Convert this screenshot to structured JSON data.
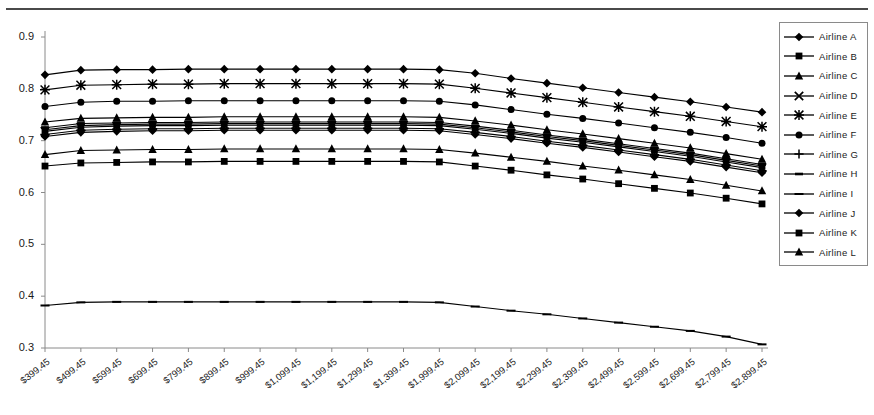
{
  "chart_data": {
    "type": "line",
    "title": "",
    "xlabel": "",
    "ylabel": "",
    "ylim": [
      0.3,
      0.9
    ],
    "ytick_labels": [
      "0.9",
      "0.8",
      "0.7",
      "0.6",
      "0.5",
      "0.4",
      "0.3"
    ],
    "ytick_values": [
      0.9,
      0.8,
      0.7,
      0.6,
      0.5,
      0.4,
      0.3
    ],
    "grid": false,
    "legend_position": "right",
    "categories": [
      "$399.45",
      "$499.45",
      "$599.45",
      "$699.45",
      "$799.45",
      "$899.45",
      "$999.45",
      "$1,099.45",
      "$1,199.45",
      "$1,299.45",
      "$1,399.45",
      "$1,999.45",
      "$2,099.45",
      "$2,199.45",
      "$2,299.45",
      "$2,399.45",
      "$2,499.45",
      "$2,599.45",
      "$2,699.45",
      "$2,799.45",
      "$2,899.45"
    ],
    "series": [
      {
        "name": "Airline A",
        "marker": "diamond",
        "values": [
          0.827,
          0.836,
          0.837,
          0.837,
          0.838,
          0.838,
          0.838,
          0.838,
          0.838,
          0.838,
          0.838,
          0.837,
          0.83,
          0.82,
          0.811,
          0.802,
          0.793,
          0.784,
          0.775,
          0.765,
          0.755
        ]
      },
      {
        "name": "Airline B",
        "marker": "square",
        "values": [
          0.651,
          0.657,
          0.658,
          0.659,
          0.659,
          0.66,
          0.66,
          0.66,
          0.66,
          0.66,
          0.66,
          0.659,
          0.651,
          0.643,
          0.634,
          0.626,
          0.617,
          0.608,
          0.599,
          0.589,
          0.578
        ]
      },
      {
        "name": "Airline C",
        "marker": "triangle",
        "values": [
          0.673,
          0.681,
          0.682,
          0.683,
          0.683,
          0.684,
          0.684,
          0.684,
          0.684,
          0.684,
          0.684,
          0.683,
          0.676,
          0.668,
          0.66,
          0.651,
          0.643,
          0.634,
          0.625,
          0.614,
          0.603
        ]
      },
      {
        "name": "Airline D",
        "marker": "x",
        "values": [
          0.718,
          0.726,
          0.728,
          0.729,
          0.729,
          0.73,
          0.73,
          0.73,
          0.73,
          0.73,
          0.73,
          0.729,
          0.722,
          0.714,
          0.705,
          0.697,
          0.688,
          0.679,
          0.67,
          0.659,
          0.648
        ]
      },
      {
        "name": "Airline E",
        "marker": "star",
        "values": [
          0.798,
          0.807,
          0.808,
          0.809,
          0.809,
          0.81,
          0.81,
          0.81,
          0.81,
          0.81,
          0.81,
          0.809,
          0.801,
          0.792,
          0.783,
          0.774,
          0.765,
          0.756,
          0.747,
          0.737,
          0.727
        ]
      },
      {
        "name": "Airline F",
        "marker": "circle",
        "values": [
          0.766,
          0.774,
          0.776,
          0.776,
          0.777,
          0.777,
          0.777,
          0.777,
          0.777,
          0.777,
          0.777,
          0.776,
          0.769,
          0.76,
          0.751,
          0.743,
          0.734,
          0.725,
          0.716,
          0.706,
          0.695
        ]
      },
      {
        "name": "Airline G",
        "marker": "plus",
        "values": [
          0.712,
          0.72,
          0.722,
          0.723,
          0.723,
          0.724,
          0.724,
          0.724,
          0.724,
          0.724,
          0.724,
          0.723,
          0.716,
          0.708,
          0.699,
          0.691,
          0.682,
          0.673,
          0.664,
          0.653,
          0.642
        ]
      },
      {
        "name": "Airline H",
        "marker": "dash",
        "values": [
          0.725,
          0.733,
          0.734,
          0.735,
          0.735,
          0.736,
          0.736,
          0.736,
          0.736,
          0.736,
          0.736,
          0.735,
          0.728,
          0.72,
          0.711,
          0.703,
          0.694,
          0.685,
          0.676,
          0.665,
          0.654
        ]
      },
      {
        "name": "Airline I",
        "marker": "line",
        "values": [
          0.382,
          0.388,
          0.389,
          0.389,
          0.389,
          0.389,
          0.389,
          0.389,
          0.389,
          0.389,
          0.389,
          0.388,
          0.38,
          0.372,
          0.365,
          0.357,
          0.349,
          0.341,
          0.333,
          0.322,
          0.307
        ]
      },
      {
        "name": "Airline J",
        "marker": "diamond",
        "values": [
          0.708,
          0.716,
          0.718,
          0.719,
          0.719,
          0.72,
          0.72,
          0.72,
          0.72,
          0.72,
          0.72,
          0.719,
          0.712,
          0.704,
          0.695,
          0.687,
          0.678,
          0.669,
          0.66,
          0.649,
          0.638
        ]
      },
      {
        "name": "Airline K",
        "marker": "square",
        "values": [
          0.721,
          0.729,
          0.731,
          0.732,
          0.732,
          0.733,
          0.733,
          0.733,
          0.733,
          0.733,
          0.733,
          0.732,
          0.725,
          0.717,
          0.708,
          0.7,
          0.691,
          0.682,
          0.673,
          0.662,
          0.651
        ]
      },
      {
        "name": "Airline L",
        "marker": "triangle",
        "values": [
          0.736,
          0.743,
          0.744,
          0.745,
          0.745,
          0.746,
          0.746,
          0.746,
          0.746,
          0.746,
          0.746,
          0.745,
          0.738,
          0.73,
          0.721,
          0.713,
          0.704,
          0.695,
          0.686,
          0.675,
          0.664
        ]
      }
    ]
  },
  "legend": {
    "items": [
      {
        "label": "Airline A",
        "marker": "diamond"
      },
      {
        "label": "Airline B",
        "marker": "square"
      },
      {
        "label": "Airline C",
        "marker": "triangle"
      },
      {
        "label": "Airline D",
        "marker": "x"
      },
      {
        "label": "Airline E",
        "marker": "star"
      },
      {
        "label": "Airline F",
        "marker": "circle"
      },
      {
        "label": "Airline G",
        "marker": "plus"
      },
      {
        "label": "Airline H",
        "marker": "dash"
      },
      {
        "label": "Airline I",
        "marker": "line"
      },
      {
        "label": "Airline J",
        "marker": "diamond"
      },
      {
        "label": "Airline K",
        "marker": "square"
      },
      {
        "label": "Airline L",
        "marker": "triangle"
      }
    ]
  },
  "colors": {
    "series": "#000000",
    "axis": "#8a8a8a",
    "text": "#1a1a1a",
    "rule": "#4a4a4a"
  }
}
